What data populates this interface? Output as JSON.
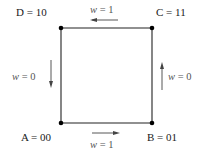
{
  "diagram": {
    "title": "",
    "nodes": [
      {
        "id": "D",
        "label": "D = 10",
        "x": 61,
        "y": 28
      },
      {
        "id": "C",
        "label": "C = 11",
        "x": 152,
        "y": 28
      },
      {
        "id": "A",
        "label": "A = 00",
        "x": 61,
        "y": 123
      },
      {
        "id": "B",
        "label": "B = 01",
        "x": 152,
        "y": 123
      }
    ],
    "edges": [
      {
        "id": "top",
        "from": "C",
        "to": "D",
        "var": "w",
        "eq": " = 1",
        "direction": "left"
      },
      {
        "id": "left",
        "from": "D",
        "to": "A",
        "var": "w",
        "eq": " = 0",
        "direction": "down"
      },
      {
        "id": "right",
        "from": "B",
        "to": "C",
        "var": "w",
        "eq": " = 0",
        "direction": "up"
      },
      {
        "id": "bottom",
        "from": "A",
        "to": "B",
        "var": "w",
        "eq": " = 1",
        "direction": "right"
      }
    ]
  }
}
